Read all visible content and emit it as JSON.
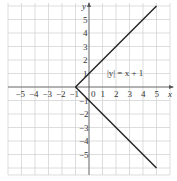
{
  "chart_data": {
    "type": "line",
    "title": "",
    "xlabel": "x",
    "ylabel": "y",
    "xlim": [
      -6,
      6
    ],
    "ylim": [
      -6.5,
      6.3
    ],
    "grid": true,
    "x_ticks": [
      "−5",
      "−4",
      "−3",
      "−2",
      "−1",
      "0",
      "1",
      "2",
      "3",
      "4",
      "5"
    ],
    "y_ticks": [
      "5",
      "4",
      "3",
      "2",
      "1",
      "−1",
      "−2",
      "−3",
      "−4",
      "−5"
    ],
    "annotation": "|y| = x + 1",
    "series": [
      {
        "name": "upper branch y = x + 1",
        "points": [
          [
            -1,
            0
          ],
          [
            5,
            6
          ]
        ]
      },
      {
        "name": "lower branch y = −(x + 1)",
        "points": [
          [
            -1,
            0
          ],
          [
            5,
            -6
          ]
        ]
      }
    ],
    "line_color": "#222222"
  },
  "labels": {
    "x_axis": "x",
    "y_axis": "y",
    "origin": "0",
    "equation": "|y| = x + 1"
  }
}
